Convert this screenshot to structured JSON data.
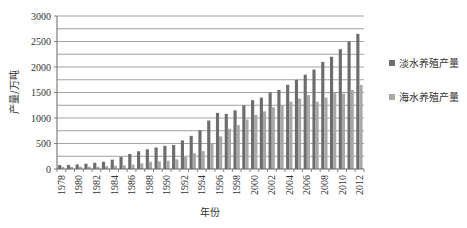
{
  "chart_data": {
    "type": "bar",
    "title": "",
    "xlabel": "年份",
    "ylabel": "产量/万吨",
    "ylim": [
      0,
      3000
    ],
    "yticks": [
      0,
      500,
      1000,
      1500,
      2000,
      2500,
      3000
    ],
    "minor_gridline_step": 250,
    "grid": true,
    "legend_position": "right",
    "categories": [
      "1978",
      "1979",
      "1980",
      "1981",
      "1982",
      "1983",
      "1984",
      "1985",
      "1986",
      "1987",
      "1988",
      "1989",
      "1990",
      "1991",
      "1992",
      "1993",
      "1994",
      "1995",
      "1996",
      "1997",
      "1998",
      "1999",
      "2000",
      "2001",
      "2002",
      "2003",
      "2004",
      "2005",
      "2006",
      "2007",
      "2008",
      "2009",
      "2010",
      "2011",
      "2012"
    ],
    "xtick_labels_shown": [
      "1978",
      "1980",
      "1982",
      "1984",
      "1986",
      "1988",
      "1990",
      "1992",
      "1994",
      "1996",
      "1998",
      "2000",
      "2002",
      "2004",
      "2006",
      "2008",
      "2010",
      "2012"
    ],
    "series": [
      {
        "name": "淡水养殖产量",
        "color": "#6d6d6d",
        "values": [
          76,
          81,
          90,
          104,
          122,
          143,
          183,
          238,
          296,
          348,
          386,
          422,
          454,
          470,
          560,
          650,
          760,
          950,
          1100,
          1080,
          1150,
          1250,
          1350,
          1400,
          1500,
          1550,
          1650,
          1750,
          1850,
          1950,
          2100,
          2200,
          2350,
          2500,
          2650
        ]
      },
      {
        "name": "海水养殖产量",
        "color": "#a8a8a8",
        "values": [
          45,
          42,
          44,
          46,
          45,
          55,
          63,
          71,
          86,
          110,
          142,
          150,
          162,
          188,
          243,
          308,
          350,
          500,
          640,
          790,
          860,
          970,
          1060,
          1130,
          1210,
          1250,
          1320,
          1380,
          1450,
          1320,
          1400,
          1500,
          1480,
          1550,
          1650
        ]
      }
    ]
  }
}
